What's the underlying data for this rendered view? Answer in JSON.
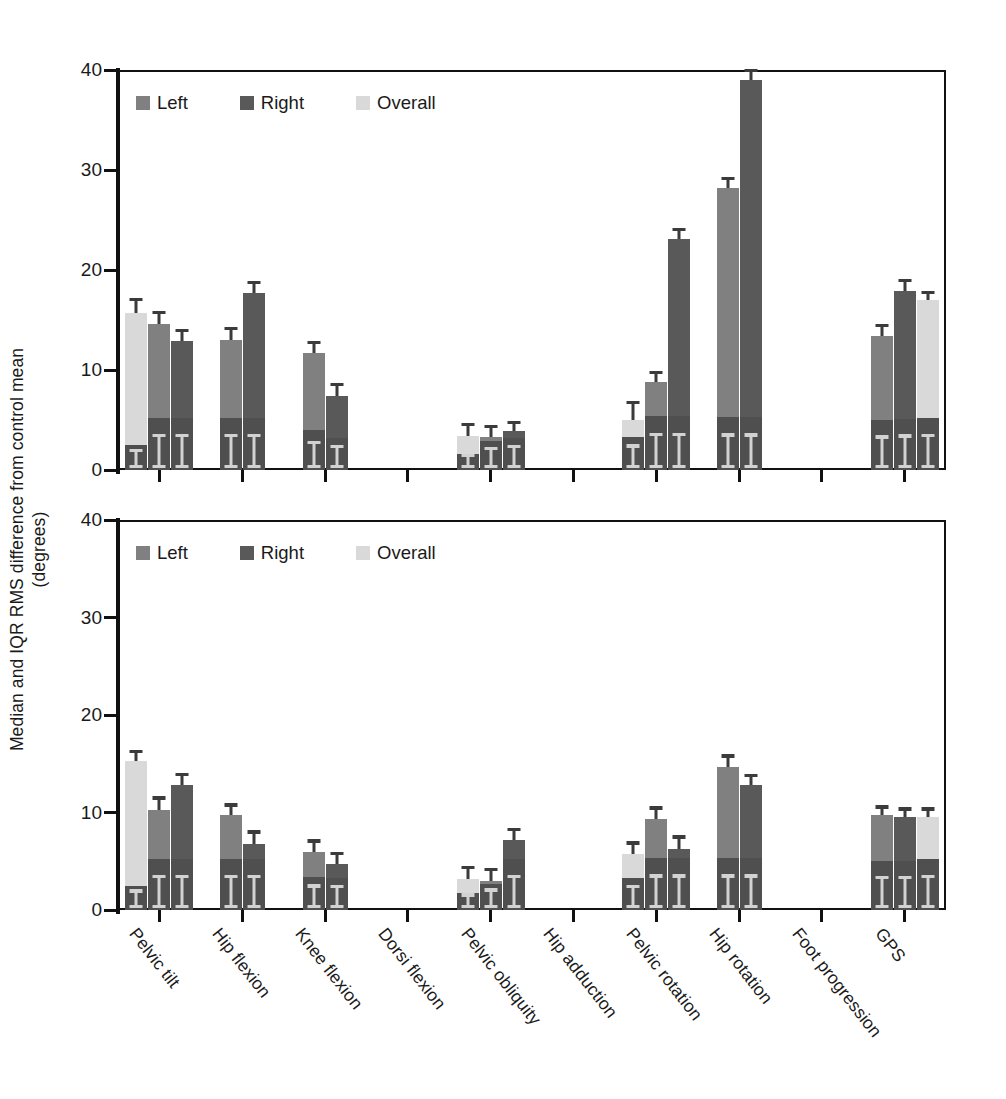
{
  "figure": {
    "ylabel_line1": "Median and IQR RMS difference from control mean",
    "ylabel_line2": "(degrees)"
  },
  "legend": {
    "items": [
      {
        "label": "Left",
        "color": "#808080"
      },
      {
        "label": "Right",
        "color": "#595959"
      },
      {
        "label": "Overall",
        "color": "#d9d9d9"
      }
    ]
  },
  "colors": {
    "left": "#808080",
    "right": "#595959",
    "overall": "#d9d9d9",
    "lower_box": "#4f4f4f",
    "error_bar": "#3b3b3b",
    "axis": "#111111"
  },
  "axis": {
    "y_ticks": [
      0,
      10,
      20,
      30,
      40
    ],
    "y_min": 0,
    "y_max": 40,
    "x_categories": [
      "Pelvic tilt",
      "Hip flexion",
      "Knee flexion",
      "Dorsi flexion",
      "Pelvic obliquity",
      "Hip adduction",
      "Pelvic rotation",
      "Hip rotation",
      "Foot progression",
      "GPS"
    ]
  },
  "chart_data": [
    {
      "type": "bar",
      "panel": "top",
      "title": "",
      "xlabel": "",
      "ylabel": "Median and IQR RMS difference from control mean (degrees)",
      "ylim": [
        0,
        40
      ],
      "grid": false,
      "legend_position": "top-left",
      "categories": [
        "Pelvic tilt",
        "Hip flexion",
        "Knee flexion",
        "Dorsi flexion",
        "Pelvic obliquity",
        "Hip adduction",
        "Pelvic rotation",
        "Hip rotation",
        "Foot progression",
        "GPS"
      ],
      "series": [
        {
          "name": "Overall",
          "color": "#d9d9d9",
          "values": [
            15.7,
            null,
            null,
            null,
            3.4,
            null,
            5.0,
            null,
            null,
            17.0
          ],
          "err_low": [
            2.5,
            null,
            null,
            null,
            1.6,
            null,
            3.3,
            null,
            null,
            5.2
          ],
          "err_high": [
            16.9,
            null,
            null,
            null,
            4.4,
            null,
            6.6,
            null,
            null,
            17.6
          ]
        },
        {
          "name": "Left",
          "color": "#808080",
          "values": [
            14.6,
            13.0,
            11.7,
            null,
            3.3,
            null,
            8.8,
            28.2,
            null,
            13.4
          ],
          "err_low": [
            5.2,
            5.2,
            4.0,
            null,
            2.9,
            null,
            5.4,
            5.3,
            null,
            5.0
          ],
          "err_high": [
            15.6,
            14.0,
            12.6,
            null,
            4.2,
            null,
            9.6,
            29.0,
            null,
            14.3
          ]
        },
        {
          "name": "Right",
          "color": "#595959",
          "values": [
            12.9,
            17.7,
            7.4,
            null,
            3.9,
            null,
            23.1,
            39.0,
            null,
            17.9
          ],
          "err_low": [
            5.2,
            5.2,
            3.2,
            null,
            3.2,
            null,
            5.4,
            5.3,
            null,
            5.1
          ],
          "err_high": [
            13.8,
            18.6,
            8.4,
            null,
            4.6,
            null,
            23.9,
            39.8,
            null,
            18.8
          ]
        }
      ],
      "group_order": [
        [
          "Overall",
          "Left",
          "Right"
        ],
        [
          "Left",
          "Right"
        ],
        [
          "Left",
          "Right"
        ],
        [],
        [
          "Overall",
          "Left",
          "Right"
        ],
        [],
        [
          "Overall",
          "Left",
          "Right"
        ],
        [
          "Left",
          "Right"
        ],
        [],
        [
          "Left",
          "Right",
          "Overall"
        ]
      ]
    },
    {
      "type": "bar",
      "panel": "bottom",
      "title": "",
      "xlabel": "",
      "ylabel": "Median and IQR RMS difference from control mean (degrees)",
      "ylim": [
        0,
        40
      ],
      "grid": false,
      "legend_position": "top-left",
      "categories": [
        "Pelvic tilt",
        "Hip flexion",
        "Knee flexion",
        "Dorsi flexion",
        "Pelvic obliquity",
        "Hip adduction",
        "Pelvic rotation",
        "Hip rotation",
        "Foot progression",
        "GPS"
      ],
      "series": [
        {
          "name": "Overall",
          "color": "#d9d9d9",
          "values": [
            15.3,
            null,
            null,
            null,
            3.2,
            null,
            5.7,
            null,
            null,
            9.5
          ],
          "err_low": [
            2.5,
            null,
            null,
            null,
            1.7,
            null,
            3.3,
            null,
            null,
            5.2
          ],
          "err_high": [
            16.1,
            null,
            null,
            null,
            4.2,
            null,
            6.7,
            null,
            null,
            10.2
          ]
        },
        {
          "name": "Left",
          "color": "#808080",
          "values": [
            10.3,
            9.7,
            5.9,
            null,
            3.0,
            null,
            9.3,
            14.7,
            null,
            9.7
          ],
          "err_low": [
            5.2,
            5.2,
            3.4,
            null,
            2.7,
            null,
            5.3,
            5.3,
            null,
            5.0
          ],
          "err_high": [
            11.3,
            10.6,
            6.9,
            null,
            4.0,
            null,
            10.3,
            15.6,
            null,
            10.4
          ]
        },
        {
          "name": "Right",
          "color": "#595959",
          "values": [
            12.8,
            6.8,
            4.7,
            null,
            7.2,
            null,
            6.3,
            12.8,
            null,
            9.5
          ],
          "err_low": [
            5.2,
            5.2,
            3.3,
            null,
            5.2,
            null,
            5.3,
            5.3,
            null,
            5.0
          ],
          "err_high": [
            13.7,
            7.8,
            5.6,
            null,
            8.1,
            null,
            7.3,
            13.6,
            null,
            10.2
          ]
        }
      ],
      "group_order": [
        [
          "Overall",
          "Left",
          "Right"
        ],
        [
          "Left",
          "Right"
        ],
        [
          "Left",
          "Right"
        ],
        [],
        [
          "Overall",
          "Left",
          "Right"
        ],
        [],
        [
          "Overall",
          "Left",
          "Right"
        ],
        [
          "Left",
          "Right"
        ],
        [],
        [
          "Left",
          "Right",
          "Overall"
        ]
      ]
    }
  ]
}
